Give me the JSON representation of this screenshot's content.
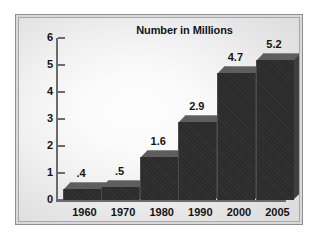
{
  "chart_data": {
    "type": "bar",
    "title": "Number in Millions",
    "xlabel": "",
    "ylabel": "",
    "categories": [
      "1960",
      "1970",
      "1980",
      "1990",
      "2000",
      "2005"
    ],
    "values": [
      0.4,
      0.5,
      1.6,
      2.9,
      4.7,
      5.2
    ],
    "value_labels": [
      ".4",
      ".5",
      "1.6",
      "2.9",
      "4.7",
      "5.2"
    ],
    "ylim": [
      0,
      6
    ],
    "ytick_labels": [
      "0",
      "1",
      "2",
      "3",
      "4",
      "5",
      "6"
    ],
    "ytick_values": [
      0,
      1,
      2,
      3,
      4,
      5,
      6
    ],
    "grid": false,
    "legend": false,
    "style": "3d-bar",
    "colors": {
      "bar_front": "#2b2b2b",
      "bar_top": "#5e5e5e",
      "bar_side": "#3f3f3f",
      "axis": "#6b6b6b",
      "text": "#141414",
      "frame": "#8e8e8e",
      "plot_background": "#f4f4f4"
    }
  }
}
